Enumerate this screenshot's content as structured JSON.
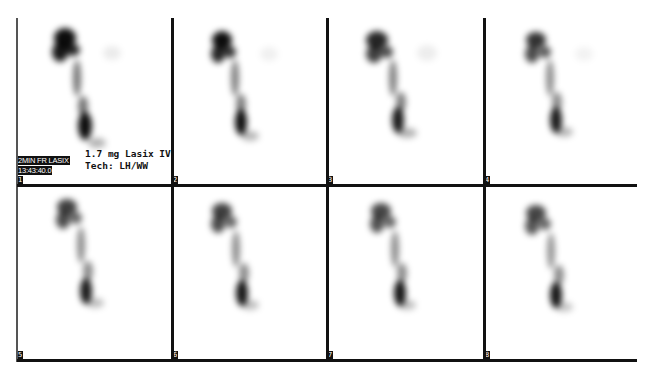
{
  "study": {
    "title_partial": "",
    "annotation": {
      "line1": "1.7 mg Lasix IV",
      "line2": "Tech: LH/WW"
    },
    "frame_tag": {
      "line1": "2MIN FR LASIX",
      "line2": "13:43:40.0"
    }
  },
  "panels": [
    {
      "number": "1",
      "intensity": 1.0
    },
    {
      "number": "2",
      "intensity": 0.95
    },
    {
      "number": "3",
      "intensity": 0.85
    },
    {
      "number": "4",
      "intensity": 0.8
    },
    {
      "number": "5",
      "intensity": 0.75
    },
    {
      "number": "6",
      "intensity": 0.75
    },
    {
      "number": "7",
      "intensity": 0.72
    },
    {
      "number": "8",
      "intensity": 0.72
    }
  ],
  "colors": {
    "grid_line": "#111111",
    "background": "#ffffff",
    "tracer": "#000000"
  }
}
